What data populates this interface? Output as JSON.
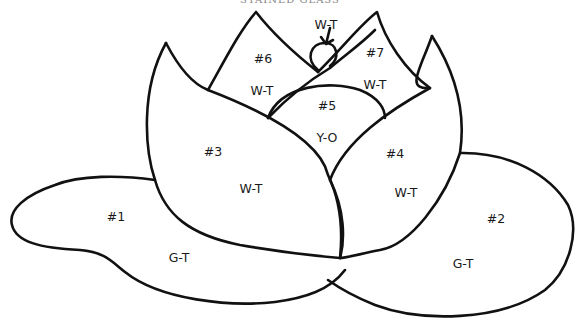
{
  "diagram": {
    "title_fragment": "STAINED GLASS",
    "line_color": "#111111",
    "background": "#ffffff",
    "pieces": [
      {
        "id": "#1",
        "color_code": "G-T",
        "region": "left leaf"
      },
      {
        "id": "#2",
        "color_code": "G-T",
        "region": "right leaf"
      },
      {
        "id": "#3",
        "color_code": "W-T",
        "region": "left outer petal"
      },
      {
        "id": "#4",
        "color_code": "W-T",
        "region": "right outer petal"
      },
      {
        "id": "#5",
        "color_code": "Y-O",
        "region": "center"
      },
      {
        "id": "#6",
        "color_code": "W-T",
        "region": "upper left petal"
      },
      {
        "id": "#7",
        "color_code": "W-T",
        "region": "upper right petal"
      }
    ],
    "bud_label": "W-T"
  }
}
